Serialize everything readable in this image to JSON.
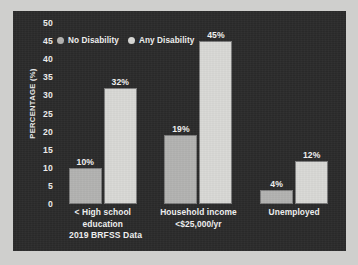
{
  "chart_data": {
    "type": "bar",
    "title": "",
    "subtitle": "",
    "xlabel": "",
    "ylabel": "PERCENTAGE (%)",
    "ylim": [
      0,
      50
    ],
    "yticks": [
      0,
      5,
      10,
      15,
      20,
      25,
      30,
      35,
      40,
      45,
      50
    ],
    "grid": false,
    "legend_position": "top-left",
    "categories": [
      "< High school education",
      "Household income\n<$25,000/yr",
      "Unemployed"
    ],
    "category_lines": [
      [
        "< High school education"
      ],
      [
        "Household income",
        "<$25,000/yr"
      ],
      [
        "Unemployed"
      ]
    ],
    "series": [
      {
        "name": "No Disability",
        "color": "#b3b3b1",
        "values": [
          10,
          19,
          4
        ],
        "labels": [
          "10%",
          "19%",
          "4%"
        ]
      },
      {
        "name": "Any Disability",
        "color": "#d9d9d6",
        "values": [
          32,
          45,
          12
        ],
        "labels": [
          "32%",
          "45%",
          "12%"
        ]
      }
    ],
    "annotations": [
      "2019 BRFSS Data"
    ]
  },
  "panel": {
    "background": "#2b2b2b",
    "text_color": "#f2f2f2",
    "page_background": "#cfcfcd"
  },
  "source_note": "2019 BRFSS Data"
}
